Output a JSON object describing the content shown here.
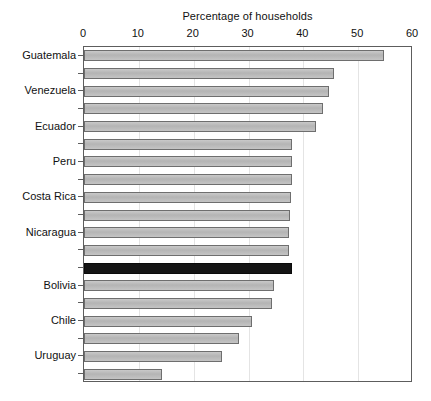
{
  "chart_data": {
    "type": "bar",
    "orientation": "horizontal",
    "title": "Percentage of households",
    "xlabel": "Percentage of households",
    "ylabel": "",
    "xlim": [
      0,
      60
    ],
    "xticks": [
      0,
      10,
      20,
      30,
      40,
      50,
      60
    ],
    "xtick_labels": [
      "0",
      "10",
      "20",
      "30",
      "40",
      "50",
      "60"
    ],
    "grid": true,
    "grid_axis": "x",
    "legend": null,
    "categories": [
      "Guatemala",
      "",
      "Venezuela",
      "",
      "Ecuador",
      "",
      "Peru",
      "",
      "Costa Rica",
      "",
      "Nicaragua",
      "",
      "",
      "Bolivia",
      "",
      "Chile",
      "",
      "Uruguay",
      ""
    ],
    "visible_category_labels": [
      "Guatemala",
      "Venezuela",
      "Ecuador",
      "Peru",
      "Costa Rica",
      "Nicaragua",
      "Bolivia",
      "Chile",
      "Uruguay"
    ],
    "values": [
      54.7,
      45.6,
      44.7,
      43.6,
      42.3,
      38.0,
      37.9,
      37.9,
      37.7,
      37.6,
      37.4,
      37.3,
      37.9,
      34.6,
      34.2,
      30.6,
      28.3,
      25.2,
      14.2
    ],
    "highlight_index": 12,
    "highlight_color": "#141414",
    "bar_color": "#bdbdbd",
    "bar_edge_color": "#6e6e6e"
  },
  "colors": {
    "background": "#ffffff",
    "axis": "#5d5d5d",
    "gridline": "#e4e4e4",
    "text": "#111111"
  }
}
